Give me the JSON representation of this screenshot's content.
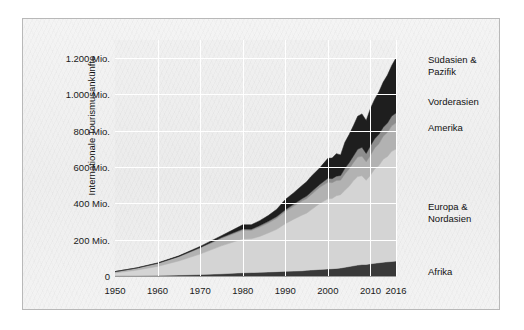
{
  "chart_data": {
    "type": "area",
    "stacked": true,
    "title": "",
    "xlabel": "",
    "ylabel": "Internationale Tourismusankünfte",
    "xlim": [
      1950,
      2016
    ],
    "ylim": [
      0,
      1300
    ],
    "grid": true,
    "legend_position": "right-inline",
    "y_ticks": [
      {
        "value": 0,
        "label": "0"
      },
      {
        "value": 200,
        "label": "200 Mio."
      },
      {
        "value": 400,
        "label": "400 Mio."
      },
      {
        "value": 600,
        "label": "600 Mio."
      },
      {
        "value": 800,
        "label": "800 Mio."
      },
      {
        "value": 1000,
        "label": "1.000 Mio."
      },
      {
        "value": 1200,
        "label": "1.200 Mio."
      }
    ],
    "x_ticks": [
      {
        "value": 1950,
        "label": "1950"
      },
      {
        "value": 1960,
        "label": "1960"
      },
      {
        "value": 1970,
        "label": "1970"
      },
      {
        "value": 1980,
        "label": "1980"
      },
      {
        "value": 1990,
        "label": "1990"
      },
      {
        "value": 2000,
        "label": "2000"
      },
      {
        "value": 2010,
        "label": "2010"
      },
      {
        "value": 2016,
        "label": "2016"
      }
    ],
    "x": [
      1950,
      1955,
      1960,
      1965,
      1970,
      1975,
      1980,
      1982,
      1984,
      1986,
      1988,
      1990,
      1992,
      1994,
      1995,
      1996,
      1998,
      2000,
      2001,
      2002,
      2003,
      2004,
      2005,
      2006,
      2007,
      2008,
      2009,
      2010,
      2011,
      2012,
      2013,
      2014,
      2015,
      2016
    ],
    "series": [
      {
        "name": "Afrika",
        "color": "#3a3a3a",
        "values": [
          1,
          2,
          3,
          5,
          8,
          12,
          18,
          19,
          20,
          22,
          24,
          26,
          27,
          29,
          31,
          33,
          36,
          39,
          40,
          42,
          44,
          48,
          52,
          56,
          60,
          63,
          64,
          67,
          70,
          73,
          76,
          78,
          80,
          82
        ]
      },
      {
        "name": "Europa & Nordasien",
        "color": "#d7d7d7",
        "values": [
          16,
          30,
          50,
          78,
          113,
          154,
          186,
          186,
          198,
          215,
          233,
          262,
          286,
          307,
          315,
          330,
          362,
          386,
          387,
          400,
          404,
          424,
          442,
          468,
          488,
          489,
          463,
          488,
          520,
          535,
          567,
          580,
          607,
          617
        ]
      },
      {
        "name": "Amerika",
        "color": "#b5b5b5",
        "values": [
          7,
          11,
          16,
          23,
          33,
          41,
          48,
          46,
          52,
          55,
          61,
          67,
          72,
          78,
          80,
          83,
          89,
          91,
          87,
          84,
          80,
          90,
          96,
          100,
          107,
          108,
          102,
          109,
          115,
          120,
          127,
          133,
          140,
          145
        ]
      },
      {
        "name": "Vorderasien",
        "color": "#8f8f8f",
        "values": [
          0.2,
          0.5,
          1,
          2,
          3,
          5,
          7,
          7,
          8,
          9,
          10,
          10,
          11,
          13,
          14,
          15,
          16,
          22,
          22,
          24,
          26,
          31,
          34,
          37,
          43,
          49,
          46,
          54,
          51,
          53,
          49,
          52,
          54,
          54
        ]
      },
      {
        "name": "Südasien & Pazifik",
        "color": "#1f1f1f",
        "values": [
          0.2,
          1,
          2,
          3,
          6,
          10,
          23,
          24,
          27,
          32,
          40,
          56,
          63,
          73,
          79,
          86,
          90,
          110,
          114,
          124,
          113,
          144,
          155,
          167,
          182,
          184,
          181,
          205,
          218,
          234,
          249,
          264,
          279,
          303
        ]
      }
    ],
    "series_labels": [
      {
        "name": "Südasien & Pazifik",
        "lines": [
          "Südasien &",
          "Pazifik"
        ]
      },
      {
        "name": "Vorderasien",
        "lines": [
          "Vorderasien"
        ]
      },
      {
        "name": "Amerika",
        "lines": [
          "Amerika"
        ]
      },
      {
        "name": "Europa & Nordasien",
        "lines": [
          "Europa &",
          "Nordasien"
        ]
      },
      {
        "name": "Afrika",
        "lines": [
          "Afrika"
        ]
      }
    ]
  },
  "axis": {
    "y_title": "Internationale Tourismusankünfte",
    "y_tick_labels": [
      "1.200 Mio.",
      "1.000 Mio.",
      "800 Mio.",
      "600 Mio.",
      "400 Mio.",
      "200 Mio.",
      "0"
    ],
    "x_tick_labels": [
      "1950",
      "1960",
      "1970",
      "1980",
      "1990",
      "2000",
      "2010",
      "2016"
    ]
  },
  "labels": {
    "suedasien_1": "Südasien &",
    "suedasien_2": "Pazifik",
    "vorderasien": "Vorderasien",
    "amerika": "Amerika",
    "europa_1": "Europa &",
    "europa_2": "Nordasien",
    "afrika": "Afrika"
  },
  "colors": {
    "afrika": "#3a3a3a",
    "europa": "#d7d7d7",
    "amerika": "#b5b5b5",
    "vorderasien": "#8f8f8f",
    "suedasien": "#1f1f1f",
    "panel_bg": "#f2f2f2",
    "grid": "#ffffff",
    "frame": "#b8b8b8"
  }
}
